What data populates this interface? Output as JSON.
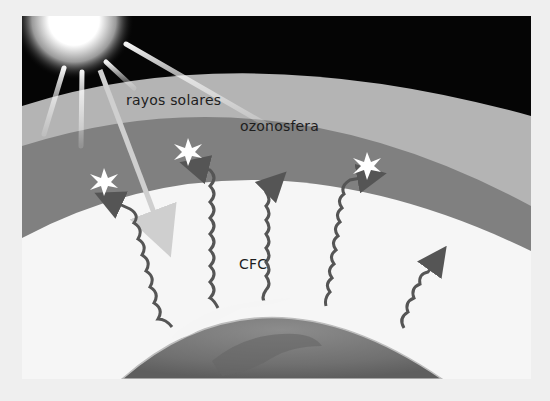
{
  "diagram": {
    "labels": {
      "solar_rays": "rayos solares",
      "ozonosphere": "ozonosfera",
      "cfc": "CFC"
    },
    "colors": {
      "page_background": "#efefef",
      "space": "#050505",
      "atmosphere": "#b4b4b4",
      "ozonosphere": "#808080",
      "lower_atmosphere": "#f6f6f6",
      "earth": "#7a7a7a",
      "cfc_arrows": "#555555",
      "sun_core": "#ffffff",
      "ray_color": "#dcdcdc"
    },
    "elements": [
      {
        "type": "sun",
        "position": "top-left"
      },
      {
        "type": "solar-ray",
        "count": 6
      },
      {
        "type": "cfc-wave-arrow",
        "count": 5,
        "hits_ozone": 3
      },
      {
        "type": "ozone-impact-star",
        "count": 3
      },
      {
        "type": "earth",
        "position": "bottom-center"
      }
    ]
  }
}
